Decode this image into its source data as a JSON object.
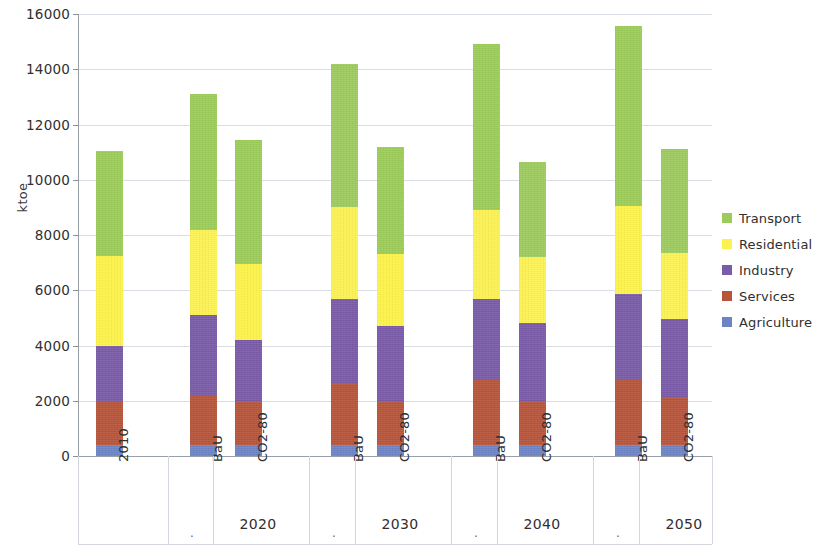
{
  "chart_data": {
    "type": "bar",
    "title": "",
    "subtitle": "",
    "stacked": true,
    "xlabel": "",
    "ylabel": "ktoe",
    "ylim": [
      0,
      16000
    ],
    "ytick_step": 2000,
    "ytick_labels": [
      "16000",
      "14000",
      "12000",
      "10000",
      "8000",
      "6000",
      "4000",
      "2000",
      "0"
    ],
    "ytick_values": [
      16000,
      14000,
      12000,
      10000,
      8000,
      6000,
      4000,
      2000,
      0
    ],
    "grid": true,
    "grid_axis": "y",
    "legend_position": "right",
    "categories": [
      "2010",
      "BaU",
      "CO2-80",
      "BaU",
      "CO2-80",
      "BaU",
      "CO2-80",
      "BaU",
      "CO2-80"
    ],
    "group_labels": [
      "",
      "2020",
      "2030",
      "2040",
      "2050"
    ],
    "series": [
      {
        "name": "Agriculture",
        "color": "#6c84c4",
        "values": [
          400,
          400,
          400,
          400,
          400,
          400,
          400,
          400,
          400
        ]
      },
      {
        "name": "Services",
        "color": "#b8543a",
        "values": [
          1600,
          1800,
          1550,
          2200,
          1550,
          2400,
          1550,
          2400,
          1700
        ]
      },
      {
        "name": "Industry",
        "color": "#7a5ba8",
        "values": [
          2000,
          2900,
          2250,
          3100,
          2750,
          2900,
          2850,
          3050,
          2850
        ]
      },
      {
        "name": "Residential",
        "color": "#fbf14f",
        "values": [
          3250,
          3100,
          2750,
          3300,
          2600,
          3200,
          2400,
          3200,
          2400
        ]
      },
      {
        "name": "Transport",
        "color": "#9ccb5c",
        "values": [
          3800,
          4900,
          4500,
          5200,
          3900,
          6000,
          3450,
          6500,
          3750
        ]
      }
    ],
    "totals": [
      11050,
      13100,
      11450,
      14200,
      11200,
      14900,
      10650,
      15550,
      11100
    ]
  },
  "legend": {
    "items": [
      {
        "label": "Transport",
        "color": "#9ccb5c",
        "icon": "square-swatch-icon"
      },
      {
        "label": "Residential",
        "color": "#fbf14f",
        "icon": "square-swatch-icon"
      },
      {
        "label": "Industry",
        "color": "#7a5ba8",
        "icon": "square-swatch-icon"
      },
      {
        "label": "Services",
        "color": "#b8543a",
        "icon": "square-swatch-icon"
      },
      {
        "label": "Agriculture",
        "color": "#6c84c4",
        "icon": "square-swatch-icon"
      }
    ]
  },
  "axes": {
    "y_title": "ktoe",
    "group_separator_dot": "."
  }
}
